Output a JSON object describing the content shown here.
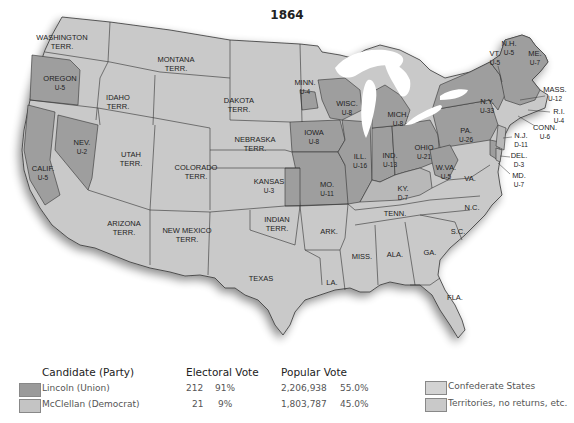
{
  "title": "1864",
  "colors": {
    "union": "#9a9a9a",
    "democrat": "#c4c4c4",
    "confederate": "#d3d3d3",
    "territory": "#c9c9c9",
    "border": "#333333",
    "water": "#ffffff"
  },
  "map_labels": [
    {
      "id": "wa",
      "name": "WASHINGTON",
      "sub": "TERR.",
      "x": 62,
      "y": 40
    },
    {
      "id": "mt",
      "name": "MONTANA",
      "sub": "TERR.",
      "x": 176,
      "y": 62
    },
    {
      "id": "or",
      "name": "OREGON",
      "sub": "U-5",
      "x": 60,
      "y": 81
    },
    {
      "id": "id",
      "name": "IDAHO",
      "sub": "TERR.",
      "x": 118,
      "y": 100
    },
    {
      "id": "dk",
      "name": "DAKOTA",
      "sub": "TERR.",
      "x": 239,
      "y": 103
    },
    {
      "id": "mn",
      "name": "MINN.",
      "sub": "U-4",
      "x": 305,
      "y": 85
    },
    {
      "id": "wi",
      "name": "WISC.",
      "sub": "U-8",
      "x": 347,
      "y": 106
    },
    {
      "id": "mi",
      "name": "MICH.",
      "sub": "U-8",
      "x": 398,
      "y": 117
    },
    {
      "id": "ny",
      "name": "N.Y.",
      "sub": "U-33",
      "x": 487,
      "y": 104
    },
    {
      "id": "vt",
      "name": "VT.",
      "sub": "U-5",
      "x": 495,
      "y": 56
    },
    {
      "id": "nh",
      "name": "N.H.",
      "sub": "U-5",
      "x": 509,
      "y": 46
    },
    {
      "id": "me",
      "name": "ME.",
      "sub": "U-7",
      "x": 535,
      "y": 56
    },
    {
      "id": "ma",
      "name": "MASS.",
      "sub": "U-12",
      "x": 555,
      "y": 92
    },
    {
      "id": "ri",
      "name": "R.I.",
      "sub": "U-4",
      "x": 559,
      "y": 114
    },
    {
      "id": "ct",
      "name": "CONN.",
      "sub": "U-6",
      "x": 545,
      "y": 130
    },
    {
      "id": "nj",
      "name": "N.J.",
      "sub": "D-11",
      "x": 521,
      "y": 138
    },
    {
      "id": "de",
      "name": "DEL.",
      "sub": "D-3",
      "x": 519,
      "y": 158
    },
    {
      "id": "md",
      "name": "MD.",
      "sub": "U-7",
      "x": 519,
      "y": 178
    },
    {
      "id": "pa",
      "name": "PA.",
      "sub": "U-26",
      "x": 466,
      "y": 133
    },
    {
      "id": "oh",
      "name": "OHIO",
      "sub": "U-21",
      "x": 424,
      "y": 150
    },
    {
      "id": "in",
      "name": "IND.",
      "sub": "U-13",
      "x": 390,
      "y": 158
    },
    {
      "id": "il",
      "name": "ILL.",
      "sub": "U-16",
      "x": 360,
      "y": 159
    },
    {
      "id": "ia",
      "name": "IOWA",
      "sub": "U-8",
      "x": 314,
      "y": 135
    },
    {
      "id": "ne",
      "name": "NEBRASKA",
      "sub": "TERR.",
      "x": 255,
      "y": 142
    },
    {
      "id": "nv",
      "name": "NEV.",
      "sub": "U-2",
      "x": 82,
      "y": 145
    },
    {
      "id": "ut",
      "name": "UTAH",
      "sub": "TERR.",
      "x": 131,
      "y": 157
    },
    {
      "id": "co",
      "name": "COLORADO",
      "sub": "TERR.",
      "x": 196,
      "y": 170
    },
    {
      "id": "ks",
      "name": "KANSAS",
      "sub": "U-3",
      "x": 269,
      "y": 184
    },
    {
      "id": "mo",
      "name": "MO.",
      "sub": "U-11",
      "x": 327,
      "y": 187
    },
    {
      "id": "ca",
      "name": "CALIF.",
      "sub": "U-5",
      "x": 43,
      "y": 171
    },
    {
      "id": "wv",
      "name": "W.VA.",
      "sub": "U-5",
      "x": 446,
      "y": 170
    },
    {
      "id": "ky",
      "name": "KY.",
      "sub": "D-7",
      "x": 403,
      "y": 191
    },
    {
      "id": "va",
      "name": "VA.",
      "sub": "",
      "x": 470,
      "y": 181
    },
    {
      "id": "tn",
      "name": "TENN.",
      "sub": "",
      "x": 395,
      "y": 216
    },
    {
      "id": "nc",
      "name": "N.C.",
      "sub": "",
      "x": 472,
      "y": 210
    },
    {
      "id": "az",
      "name": "ARIZONA",
      "sub": "TERR.",
      "x": 124,
      "y": 226
    },
    {
      "id": "nm",
      "name": "NEW MEXICO",
      "sub": "TERR.",
      "x": 187,
      "y": 233
    },
    {
      "id": "it",
      "name": "INDIAN",
      "sub": "TERR.",
      "x": 277,
      "y": 222
    },
    {
      "id": "ar",
      "name": "ARK.",
      "sub": "",
      "x": 329,
      "y": 234
    },
    {
      "id": "sc",
      "name": "S.C.",
      "sub": "",
      "x": 458,
      "y": 234
    },
    {
      "id": "ms",
      "name": "MISS.",
      "sub": "",
      "x": 362,
      "y": 259
    },
    {
      "id": "al",
      "name": "ALA.",
      "sub": "",
      "x": 395,
      "y": 257
    },
    {
      "id": "ga",
      "name": "GA.",
      "sub": "",
      "x": 430,
      "y": 255
    },
    {
      "id": "tx",
      "name": "TEXAS",
      "sub": "",
      "x": 261,
      "y": 281
    },
    {
      "id": "la",
      "name": "LA.",
      "sub": "",
      "x": 332,
      "y": 285
    },
    {
      "id": "fl",
      "name": "FLA.",
      "sub": "",
      "x": 455,
      "y": 300
    }
  ],
  "legend": {
    "headers": {
      "candidate": "Candidate (Party)",
      "electoral": "Electoral Vote",
      "popular": "Popular Vote"
    },
    "rows": [
      {
        "candidate": "Lincoln (Union)",
        "electoral_votes": "212",
        "electoral_pct": "91%",
        "popular_votes": "2,206,938",
        "popular_pct": "55.0%"
      },
      {
        "candidate": "McClellan (Democrat)",
        "electoral_votes": "21",
        "electoral_pct": "9%",
        "popular_votes": "1,803,787",
        "popular_pct": "45.0%"
      }
    ],
    "other": [
      {
        "label": "Confederate States"
      },
      {
        "label": "Territories, no returns, etc."
      }
    ]
  }
}
